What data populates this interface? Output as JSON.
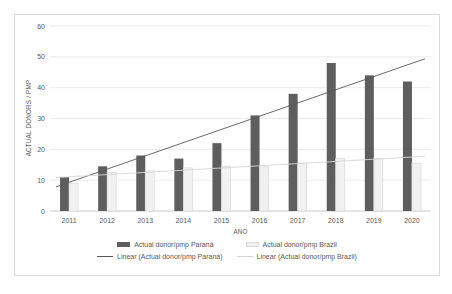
{
  "chart": {
    "y_axis_title": "ACTUAL DONORS / PMP",
    "x_axis_title": "ANO"
  },
  "legend": {
    "items": [
      {
        "label": "Actual donor/pmp Paraná",
        "swatch": "bar-dark"
      },
      {
        "label": "Actual donor/pmp Brazil",
        "swatch": "bar-light"
      },
      {
        "label": "Linear (Actual donor/pmp Paraná)",
        "swatch": "line-dark"
      },
      {
        "label": "Linear (Actual donor/pmp Brazil)",
        "swatch": "line-light"
      }
    ]
  },
  "colors": {
    "parana_bar": "#5e5e5e",
    "brazil_bar_fill": "#f1f1f1",
    "brazil_bar_border": "#d9d9d9",
    "parana_trend": "#595959",
    "brazil_trend": "#d6d6d6",
    "gridline": "#ebebeb",
    "axis_line": "#c9c9c9",
    "text": "#595959",
    "frame_border": "#d9d9d9"
  },
  "chart_data": {
    "type": "bar",
    "title": "",
    "categories": [
      "2011",
      "2012",
      "2013",
      "2014",
      "2015",
      "2016",
      "2017",
      "2018",
      "2019",
      "2020"
    ],
    "series": [
      {
        "name": "Actual donor/pmp Paraná",
        "values": [
          11,
          14.5,
          18,
          17,
          22,
          31,
          38,
          48,
          44,
          42
        ],
        "color": "#5e5e5e"
      },
      {
        "name": "Actual donor/pmp Brazil",
        "values": [
          9,
          12.5,
          13,
          14,
          14.5,
          14.5,
          15.5,
          17,
          17,
          15.5
        ],
        "color": "#f1f1f1",
        "border_color": "#d9d9d9"
      }
    ],
    "trendlines": [
      {
        "name": "Linear (Actual donor/pmp Paraná)",
        "start_value": 9.3,
        "end_value": 47.9,
        "color": "#595959"
      },
      {
        "name": "Linear (Actual donor/pmp Brazil)",
        "start_value": 11.1,
        "end_value": 17.5,
        "color": "#d6d6d6"
      }
    ],
    "xlabel": "ANO",
    "ylabel": "ACTUAL DONORS / PMP",
    "ylim": [
      0,
      60
    ],
    "yticks": [
      0,
      10,
      20,
      30,
      40,
      50,
      60
    ],
    "grid": true,
    "legend_position": "bottom"
  }
}
